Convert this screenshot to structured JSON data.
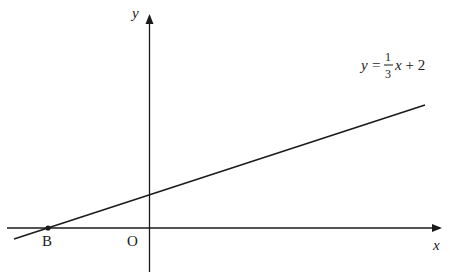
{
  "diagram": {
    "type": "coordinate-plane",
    "axes": {
      "x_label": "x",
      "y_label": "y",
      "origin_label": "O"
    },
    "line": {
      "equation_lhs": "y =",
      "fraction_numerator": "1",
      "fraction_denominator": "3",
      "equation_rhs": "x + 2",
      "slope": 0.3333,
      "intercept": 2
    },
    "points": [
      {
        "label": "B",
        "description": "x-intercept of line"
      }
    ],
    "colors": {
      "stroke": "#1a1a1a",
      "background": "#ffffff"
    }
  }
}
